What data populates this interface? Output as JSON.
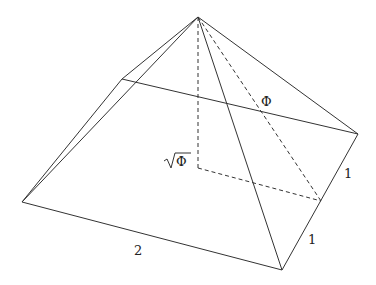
{
  "diagram": {
    "type": "pyramid",
    "labels": {
      "slant_height": "Φ",
      "height": "√Φ",
      "height_radicand": "Φ",
      "base_side": "2",
      "half_side_upper": "1",
      "half_side_lower": "1"
    },
    "colors": {
      "line": "#333333",
      "text": "#222222",
      "background": "#ffffff"
    }
  }
}
